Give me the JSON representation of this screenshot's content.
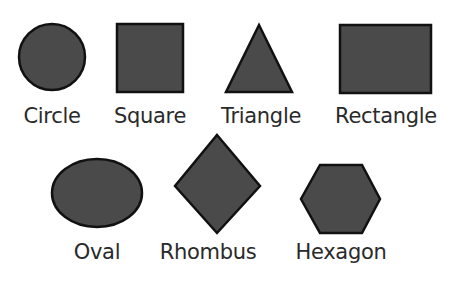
{
  "colors": {
    "fill": "#4a4a4a",
    "stroke": "#111111",
    "label": "#2a2a2a"
  },
  "shapes": [
    {
      "name": "circle",
      "label": "Circle"
    },
    {
      "name": "square",
      "label": "Square"
    },
    {
      "name": "triangle",
      "label": "Triangle"
    },
    {
      "name": "rectangle",
      "label": "Rectangle"
    },
    {
      "name": "oval",
      "label": "Oval"
    },
    {
      "name": "rhombus",
      "label": "Rhombus"
    },
    {
      "name": "hexagon",
      "label": "Hexagon"
    }
  ]
}
